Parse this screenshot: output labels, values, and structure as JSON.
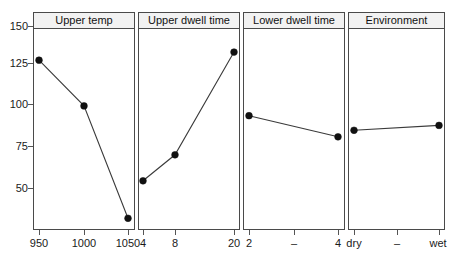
{
  "chart_data": {
    "type": "line",
    "title": "",
    "subtitle": "",
    "xlabel": "",
    "ylabel": "",
    "ylim": [
      25,
      155
    ],
    "yticks": [
      150,
      125,
      100,
      75,
      50
    ],
    "ytick_labels": [
      "150",
      "125",
      "100",
      "75",
      "50"
    ],
    "grid": false,
    "legend": "none",
    "panels": [
      {
        "name": "Upper temp",
        "categories": [
          "950",
          "1000",
          "1050"
        ],
        "tick_labels": [
          "950",
          "1000",
          "1050"
        ],
        "values": [
          129,
          101,
          32
        ]
      },
      {
        "name": "Upper dwell time",
        "categories": [
          "4",
          "8",
          "20"
        ],
        "tick_labels": [
          "4",
          "8",
          "20"
        ],
        "values": [
          55,
          71,
          134
        ]
      },
      {
        "name": "Lower dwell time",
        "categories": [
          "2",
          "-",
          "4"
        ],
        "tick_labels": [
          "2",
          "–",
          "4"
        ],
        "values": [
          95,
          null,
          82
        ]
      },
      {
        "name": "Environment",
        "categories": [
          "dry",
          "-",
          "wet"
        ],
        "tick_labels": [
          "dry",
          "–",
          "wet"
        ],
        "values": [
          86,
          null,
          89
        ]
      }
    ],
    "colors": {
      "line": "#3a3a3a",
      "marker": "#111111",
      "panel_border": "#4a4a4a",
      "header_fill": "#f2f2f2",
      "background": "#ffffff",
      "text": "#1a1a1a"
    }
  },
  "panel_titles": {
    "p0": "Upper temp",
    "p1": "Upper dwell time",
    "p2": "Lower dwell time",
    "p3": "Environment"
  },
  "y_axis": {
    "t0": "150",
    "t1": "125",
    "t2": "100",
    "t3": "75",
    "t4": "50"
  },
  "x_axis": {
    "p0": {
      "l0": "950",
      "l1": "1000",
      "l2": "1050"
    },
    "p1": {
      "l0": "4",
      "l1": "8",
      "l2": "20"
    },
    "p2": {
      "l0": "2",
      "l1": "–",
      "l2": "4"
    },
    "p3": {
      "l0": "dry",
      "l1": "–",
      "l2": "wet"
    }
  }
}
